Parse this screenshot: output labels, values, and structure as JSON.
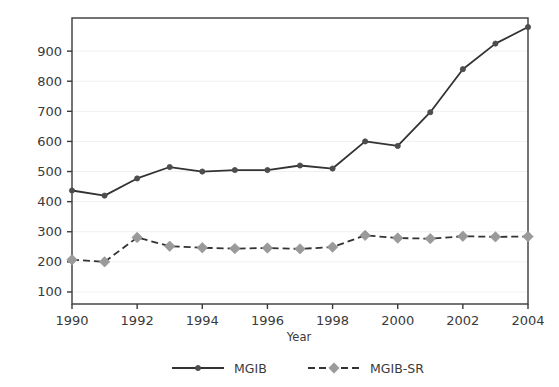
{
  "chart_data": {
    "type": "line",
    "title": "",
    "xlabel": "Year",
    "ylabel": "",
    "grid": true,
    "legend_position": "bottom",
    "x": [
      1990,
      1991,
      1992,
      1993,
      1994,
      1995,
      1996,
      1997,
      1998,
      1999,
      2000,
      2001,
      2002,
      2003,
      2004
    ],
    "categories": [
      "1990",
      "1991",
      "1992",
      "1993",
      "1994",
      "1995",
      "1996",
      "1997",
      "1998",
      "1999",
      "2000",
      "2001",
      "2002",
      "2003",
      "2004"
    ],
    "xlim": [
      1990,
      2004
    ],
    "ylim": [
      60,
      1010
    ],
    "x_tick_labels": [
      "1990",
      "1992",
      "1994",
      "1996",
      "1998",
      "2000",
      "2002",
      "2004"
    ],
    "x_tick_values": [
      1990,
      1992,
      1994,
      1996,
      1998,
      2000,
      2002,
      2004
    ],
    "y_tick_labels": [
      "100",
      "200",
      "300",
      "400",
      "500",
      "600",
      "700",
      "800",
      "900"
    ],
    "y_tick_values": [
      100,
      200,
      300,
      400,
      500,
      600,
      700,
      800,
      900
    ],
    "series": [
      {
        "name": "MGIB",
        "color": "#333333",
        "marker": "circle",
        "marker_color": "#4d4d4d",
        "dash": "solid",
        "values": [
          437,
          420,
          477,
          515,
          500,
          505,
          505,
          520,
          510,
          600,
          585,
          697,
          840,
          925,
          980
        ]
      },
      {
        "name": "MGIB-SR",
        "color": "#333333",
        "marker": "diamond",
        "marker_color": "#9a9a9a",
        "dash": "dashed",
        "values": [
          207,
          200,
          281,
          252,
          247,
          244,
          246,
          243,
          249,
          288,
          279,
          277,
          285,
          283,
          284
        ]
      }
    ]
  },
  "legend": {
    "items": [
      {
        "label": "MGIB"
      },
      {
        "label": "MGIB-SR"
      }
    ]
  },
  "axes": {
    "x_title": "Year"
  },
  "style": {
    "frame_color": "#3a3a3a",
    "grid_color": "#f0f0f0",
    "background": "#ffffff"
  }
}
